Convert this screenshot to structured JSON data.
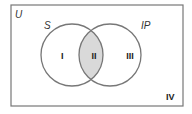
{
  "diagram": {
    "type": "venn",
    "universe_label": "U",
    "sets": [
      {
        "name": "S",
        "label": "S"
      },
      {
        "name": "IP",
        "label": "IP"
      }
    ],
    "regions": [
      {
        "id": "I",
        "label": "I",
        "description": "S only"
      },
      {
        "id": "II",
        "label": "II",
        "description": "S ∩ IP",
        "shaded": true
      },
      {
        "id": "III",
        "label": "III",
        "description": "IP only"
      },
      {
        "id": "IV",
        "label": "IV",
        "description": "outside both"
      }
    ],
    "colors": {
      "stroke": "#777777",
      "shade": "#d9d9d9",
      "background": "#ffffff"
    }
  }
}
